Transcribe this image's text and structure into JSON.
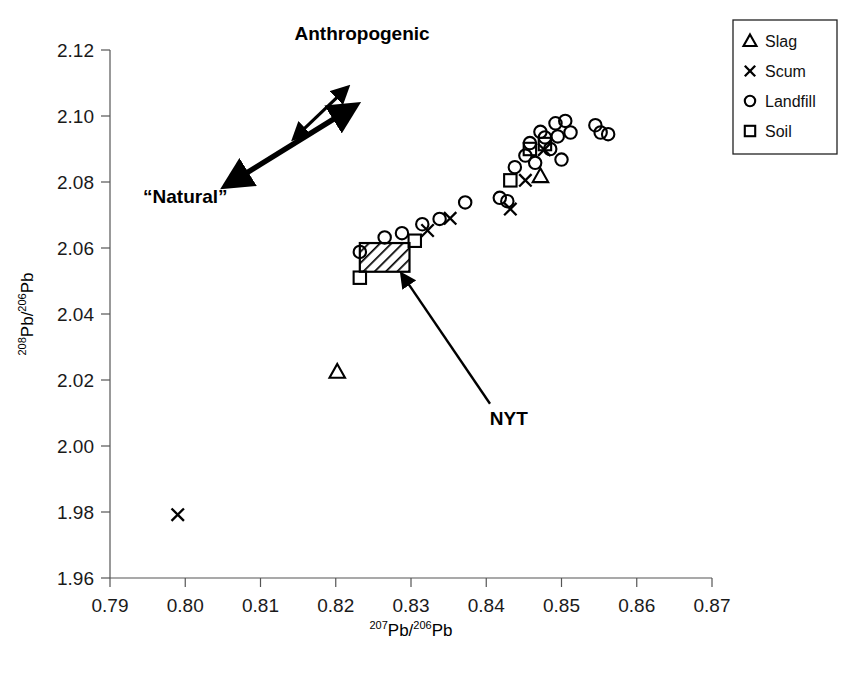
{
  "chart_data": {
    "type": "scatter",
    "title": "",
    "xlabel": "207Pb/206Pb",
    "ylabel": "208Pb/206Pb",
    "xlabel_parts": {
      "sup1": "207",
      "base1": "Pb/",
      "sup2": "206",
      "base2": "Pb"
    },
    "ylabel_parts": {
      "sup1": "208",
      "base1": "Pb/",
      "sup2": "206",
      "base2": "Pb"
    },
    "xlim": [
      0.79,
      0.87
    ],
    "ylim": [
      1.96,
      2.12
    ],
    "xticks": [
      "0.79",
      "0.80",
      "0.81",
      "0.82",
      "0.83",
      "0.84",
      "0.85",
      "0.86",
      "0.87"
    ],
    "yticks": [
      "1.96",
      "1.98",
      "2.00",
      "2.02",
      "2.04",
      "2.06",
      "2.08",
      "2.10",
      "2.12"
    ],
    "xtick_values": [
      0.79,
      0.8,
      0.81,
      0.82,
      0.83,
      0.84,
      0.85,
      0.86,
      0.87
    ],
    "ytick_values": [
      1.96,
      1.98,
      2.0,
      2.02,
      2.04,
      2.06,
      2.08,
      2.1,
      2.12
    ],
    "grid": false,
    "legend_position": "top-right",
    "series": [
      {
        "name": "Slag",
        "marker": "triangle",
        "points": [
          [
            0.8202,
            2.0225
          ],
          [
            0.8472,
            2.0818
          ]
        ]
      },
      {
        "name": "Scum",
        "marker": "x",
        "points": [
          [
            0.799,
            1.9792
          ],
          [
            0.8322,
            2.0653
          ],
          [
            0.8352,
            2.069
          ],
          [
            0.8432,
            2.0718
          ],
          [
            0.8452,
            2.0805
          ],
          [
            0.8477,
            2.0898
          ]
        ]
      },
      {
        "name": "Landfill",
        "marker": "circle",
        "points": [
          [
            0.8232,
            2.0588
          ],
          [
            0.8265,
            2.0632
          ],
          [
            0.8288,
            2.0645
          ],
          [
            0.8315,
            2.0672
          ],
          [
            0.8338,
            2.0688
          ],
          [
            0.8372,
            2.0738
          ],
          [
            0.8418,
            2.0752
          ],
          [
            0.8428,
            2.0742
          ],
          [
            0.8438,
            2.0845
          ],
          [
            0.8452,
            2.088
          ],
          [
            0.8458,
            2.0918
          ],
          [
            0.8465,
            2.0858
          ],
          [
            0.8472,
            2.0952
          ],
          [
            0.8478,
            2.0935
          ],
          [
            0.8485,
            2.09
          ],
          [
            0.8492,
            2.0978
          ],
          [
            0.8495,
            2.0938
          ],
          [
            0.85,
            2.0868
          ],
          [
            0.8505,
            2.0985
          ],
          [
            0.8512,
            2.095
          ],
          [
            0.8545,
            2.0972
          ],
          [
            0.8552,
            2.095
          ],
          [
            0.8562,
            2.0945
          ]
        ]
      },
      {
        "name": "Soil",
        "marker": "square",
        "points": [
          [
            0.8232,
            2.051
          ],
          [
            0.8305,
            2.0622
          ],
          [
            0.8432,
            2.0805
          ],
          [
            0.8458,
            2.09
          ],
          [
            0.8478,
            2.0915
          ]
        ]
      }
    ],
    "annotations": [
      {
        "name": "anthropogenic-label",
        "text": "Anthropogenic",
        "x": 0.8235,
        "y": 2.123
      },
      {
        "name": "natural-label",
        "text": "“Natural”",
        "x": 0.8,
        "y": 2.0735
      },
      {
        "name": "nyt-label",
        "text": "NYT",
        "x": 0.843,
        "y": 2.0065
      }
    ],
    "regions": [
      {
        "name": "NYT",
        "type": "hatched-box",
        "x0": 0.8232,
        "x1": 0.8298,
        "y0": 2.0528,
        "y1": 2.0615,
        "hatch": "diagonal"
      }
    ],
    "arrows": [
      {
        "name": "natural-anthropogenic-trend-arrow",
        "style": "double-headed-thick",
        "from": [
          0.8055,
          2.079
        ],
        "to": [
          0.8225,
          2.103
        ]
      },
      {
        "name": "anthropogenic-indicator-arrow",
        "style": "double-headed-thin",
        "from": [
          0.8145,
          2.0933
        ],
        "to": [
          0.8215,
          2.1085
        ]
      },
      {
        "name": "nyt-pointer-arrow",
        "style": "single-headed",
        "from": [
          0.8405,
          2.0128
        ],
        "to": [
          0.8288,
          2.052
        ]
      }
    ]
  },
  "legend": {
    "name": "chart-legend",
    "entries": [
      {
        "symbol": "△",
        "marker": "triangle",
        "label": "Slag"
      },
      {
        "symbol": "✕",
        "marker": "x",
        "label": "Scum"
      },
      {
        "symbol": "○",
        "marker": "circle",
        "label": "Landfill"
      },
      {
        "symbol": "□",
        "marker": "square",
        "label": "Soil"
      }
    ]
  },
  "colors": {
    "ink": "#000000",
    "axis": "#555555",
    "background": "#ffffff",
    "tick_text": "#1a1a1a"
  }
}
